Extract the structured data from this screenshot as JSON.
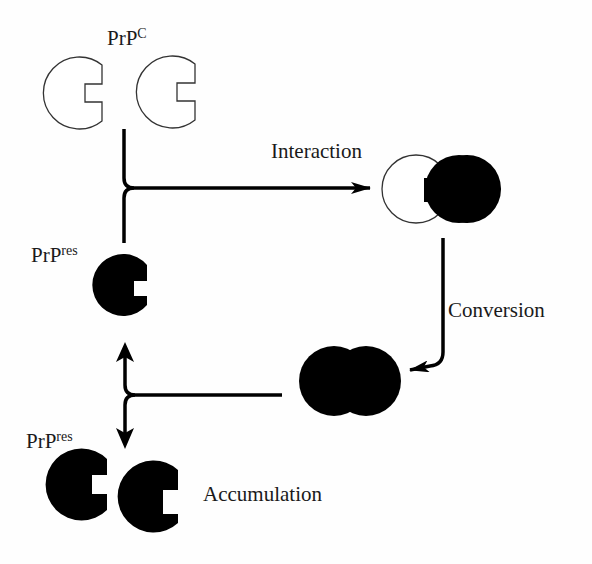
{
  "diagram": {
    "colors": {
      "fill_dark": "#000000",
      "outline": "#333333",
      "background": "#fefefe",
      "text": "#1a1a1a"
    },
    "labels": {
      "prpc": {
        "base": "PrP",
        "sup": "C"
      },
      "prpres_top": {
        "base": "PrP",
        "sup": "res"
      },
      "prpres_bottom": {
        "base": "PrP",
        "sup": "res"
      },
      "interaction": "Interaction",
      "conversion": "Conversion",
      "accumulation": "Accumulation"
    },
    "nodes": [
      {
        "id": "prpc-monomer-1",
        "type": "open-c-shape",
        "fill": "white"
      },
      {
        "id": "prpc-monomer-2",
        "type": "open-c-shape",
        "fill": "white"
      },
      {
        "id": "prpres-monomer",
        "type": "c-shape",
        "fill": "black"
      },
      {
        "id": "interaction-complex",
        "type": "heterodimer",
        "fill": "white+black"
      },
      {
        "id": "converted-dimer",
        "type": "homodimer",
        "fill": "black"
      },
      {
        "id": "accumulated-prpres-1",
        "type": "c-shape",
        "fill": "black"
      },
      {
        "id": "accumulated-prpres-2",
        "type": "c-shape",
        "fill": "black"
      }
    ],
    "edges": [
      {
        "from": "prpc + prpres",
        "to": "interaction-complex",
        "label": "Interaction"
      },
      {
        "from": "interaction-complex",
        "to": "converted-dimer",
        "label": "Conversion"
      },
      {
        "from": "converted-dimer",
        "to": "prpres-monomer",
        "label": ""
      },
      {
        "from": "converted-dimer",
        "to": "accumulated-prpres",
        "label": "Accumulation"
      }
    ]
  }
}
